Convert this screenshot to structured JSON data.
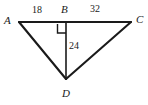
{
  "figure": {
    "width": 148,
    "height": 105,
    "background_color": "#ffffff",
    "stroke_color": "#1a1a1a",
    "text_color": "#1a1a1a"
  },
  "vertices": [
    {
      "name": "A",
      "label": "A",
      "x": 19,
      "y": 22
    },
    {
      "name": "B",
      "label": "B",
      "x": 66,
      "y": 24
    },
    {
      "name": "C",
      "label": "C",
      "x": 131,
      "y": 22
    },
    {
      "name": "D",
      "label": "D",
      "x": 66,
      "y": 79
    }
  ],
  "segments": [
    {
      "name": "segment-AC",
      "from": "A",
      "to": "C"
    },
    {
      "name": "segment-AD",
      "from": "A",
      "to": "D"
    },
    {
      "name": "segment-BD",
      "from": "B",
      "to": "D"
    },
    {
      "name": "segment-DC",
      "from": "D",
      "to": "C"
    }
  ],
  "measures": {
    "ab": "18",
    "bc": "32",
    "bd": "24"
  },
  "markers": {
    "right_angle_at": "B",
    "right_angle_note": "square mark between BA and BD"
  }
}
